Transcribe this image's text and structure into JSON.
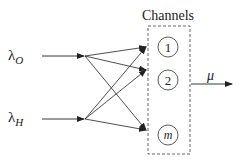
{
  "title": "Channels",
  "inputs": [
    {
      "symbol": "λ",
      "subscript": "O"
    },
    {
      "symbol": "λ",
      "subscript": "H"
    }
  ],
  "channels": [
    "1",
    "2",
    "m"
  ],
  "output": {
    "label": "μ"
  },
  "colors": {
    "stroke": "#222222",
    "background": "#ffffff"
  }
}
